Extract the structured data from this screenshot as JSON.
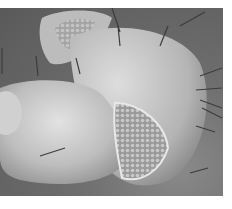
{
  "image": {
    "subject": "SEM micrograph of a rounded segment with bristles and a textured cup-shaped opening",
    "colors": {
      "background": "#5f5f5f",
      "surface_light": "#d8d8d8",
      "surface_mid": "#b0b0b0",
      "shadow": "#3a3a3a",
      "border": "#ffffff"
    }
  }
}
